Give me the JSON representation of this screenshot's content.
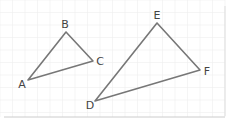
{
  "diagram": {
    "grid": {
      "spacing": 12.5,
      "color": "#eeeeee"
    },
    "triangles": [
      {
        "name": "ABC",
        "vertices": [
          {
            "label": "A",
            "x": 28,
            "y": 80,
            "lx": 22,
            "ly": 88
          },
          {
            "label": "B",
            "x": 66,
            "y": 32,
            "lx": 65,
            "ly": 28
          },
          {
            "label": "C",
            "x": 93,
            "y": 61,
            "lx": 100,
            "ly": 65
          }
        ]
      },
      {
        "name": "DEF",
        "vertices": [
          {
            "label": "D",
            "x": 95,
            "y": 101,
            "lx": 90,
            "ly": 109
          },
          {
            "label": "E",
            "x": 157,
            "y": 23,
            "lx": 157,
            "ly": 19
          },
          {
            "label": "F",
            "x": 200,
            "y": 70,
            "lx": 207,
            "ly": 75
          }
        ]
      }
    ],
    "line_color": "#777777",
    "label_color": "#444444"
  }
}
